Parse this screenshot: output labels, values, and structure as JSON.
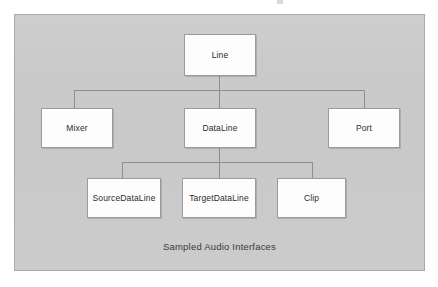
{
  "diagram": {
    "caption": "Sampled Audio Interfaces",
    "panel_color": "#c9c9c9",
    "node_fill": "#fdfdfd",
    "node_border": "#9b9b9b",
    "connector_color": "#8e8e8e",
    "arrowhead_color": "#3a3a3a",
    "type": "uml-class-hierarchy",
    "nodes": [
      {
        "id": "line",
        "label": "Line",
        "level": 0
      },
      {
        "id": "mixer",
        "label": "Mixer",
        "level": 1
      },
      {
        "id": "dataline",
        "label": "DataLine",
        "level": 1
      },
      {
        "id": "port",
        "label": "Port",
        "level": 1
      },
      {
        "id": "sourcedataline",
        "label": "SourceDataLine",
        "level": 2
      },
      {
        "id": "targetdataline",
        "label": "TargetDataLine",
        "level": 2
      },
      {
        "id": "clip",
        "label": "Clip",
        "level": 2
      }
    ],
    "edges": [
      {
        "from": "mixer",
        "to": "line",
        "kind": "generalization"
      },
      {
        "from": "dataline",
        "to": "line",
        "kind": "generalization"
      },
      {
        "from": "port",
        "to": "line",
        "kind": "generalization"
      },
      {
        "from": "sourcedataline",
        "to": "dataline",
        "kind": "generalization"
      },
      {
        "from": "targetdataline",
        "to": "dataline",
        "kind": "generalization"
      },
      {
        "from": "clip",
        "to": "dataline",
        "kind": "generalization"
      }
    ]
  }
}
